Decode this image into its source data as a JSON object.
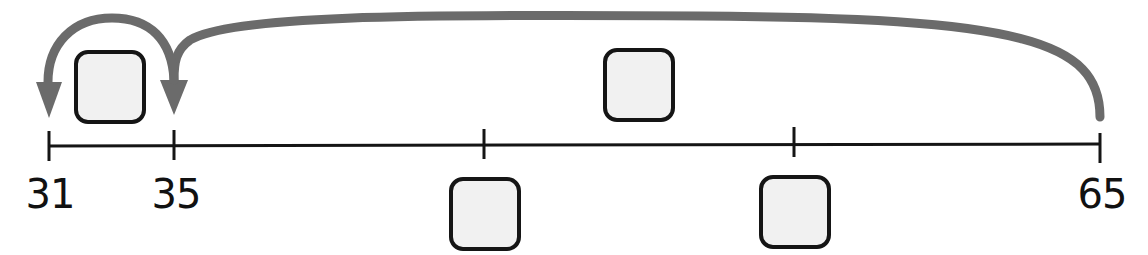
{
  "diagram": {
    "type": "number-line-jumps",
    "colors": {
      "line": "#151515",
      "arrow": "#6b6b6b",
      "box_fill": "#f1f1f1",
      "box_border": "#151515"
    },
    "number_line": {
      "labels": [
        {
          "value": "31",
          "x": 48
        },
        {
          "value": "35",
          "x": 174
        },
        {
          "value": "65",
          "x": 1100
        }
      ],
      "unlabeled_ticks": [
        484,
        794
      ]
    },
    "jumps": [
      {
        "from": "65",
        "to": "35",
        "label_box": "blank"
      },
      {
        "from": "35",
        "to": "31",
        "label_box": "blank"
      }
    ],
    "blank_boxes": [
      {
        "id": "small-jump-box",
        "value": ""
      },
      {
        "id": "big-jump-box",
        "value": ""
      },
      {
        "id": "tick-1-box",
        "value": ""
      },
      {
        "id": "tick-2-box",
        "value": ""
      }
    ]
  }
}
